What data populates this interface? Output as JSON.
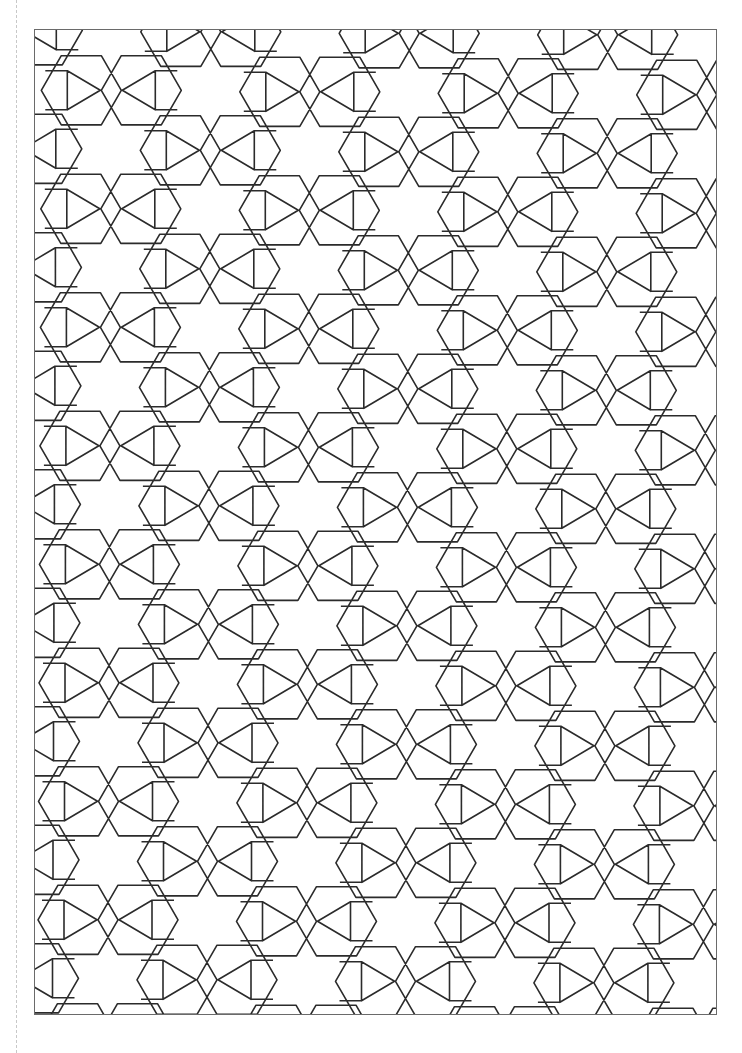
{
  "page": {
    "type": "coloring-page",
    "background": "#ffffff",
    "line_color": "#2b2b2b",
    "frame_color": "#6a6a6a",
    "cut_line_color": "#c8c8c8"
  },
  "pattern": {
    "origin": [
      76.3,
      60.3
    ],
    "lattice_a": [
      99.0,
      60.0
    ],
    "lattice_b": [
      -0.47,
      118.5
    ],
    "hex_offset": 30,
    "hex_radius": 40,
    "kite_dx": 44,
    "kite_half_height": 19.5,
    "bowtie_half_width": 11,
    "stroke_width": 1.6
  }
}
